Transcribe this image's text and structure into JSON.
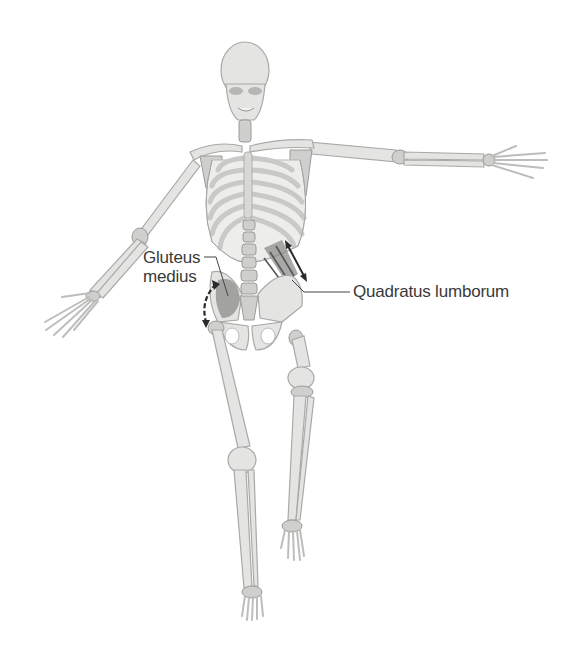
{
  "figure": {
    "background_color": "#ffffff",
    "bone_color": "#e4e4e2",
    "muscle_color": "#8c8c8a",
    "label_color": "#3a3a3a"
  },
  "labels": {
    "gluteus_medius": {
      "line1": "Gluteus",
      "line2": "medius"
    },
    "quadratus_lumborum": "Quadratus lumborum"
  },
  "icons": {
    "gluteus_arrow": "curved-double-arrow-icon",
    "quadratus_arrow": "double-arrow-icon"
  }
}
